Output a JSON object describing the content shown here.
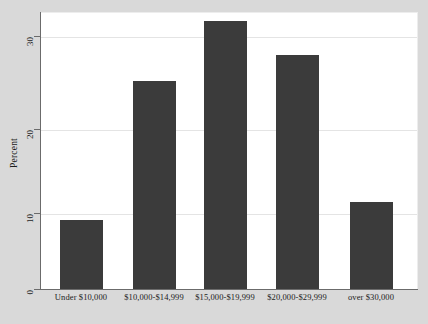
{
  "chart_data": {
    "type": "bar",
    "title": "",
    "xlabel": "",
    "ylabel": "Percent",
    "categories": [
      "Under $10,000",
      "$10,000-$14,999",
      "$15,000-$19,999",
      "$20,000-$29,999",
      "over $30,000"
    ],
    "values": [
      8,
      24,
      31,
      27,
      10
    ],
    "ylim": [
      0,
      32
    ],
    "yticks": [
      0,
      10,
      20,
      30
    ],
    "ytick_labels": [
      "0",
      "10",
      "20",
      "30"
    ],
    "grid": true,
    "legend": "none",
    "bar_color": "#3b3b3b",
    "plot_background": "#ffffff",
    "figure_background": "#d9d9d9",
    "gridline_color": "#e4e4e4",
    "axis_color": "#6b6b6b"
  }
}
